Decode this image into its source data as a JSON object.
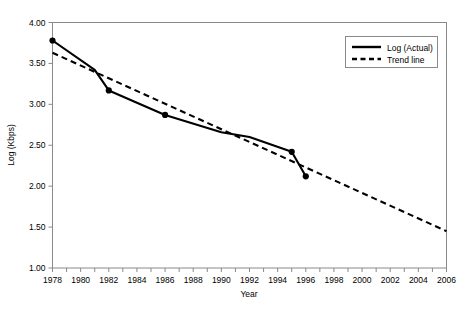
{
  "chart_data": {
    "type": "line",
    "title": "",
    "xlabel": "Year",
    "ylabel": "Log (Kbps)",
    "xlim": [
      1978,
      2006
    ],
    "ylim": [
      1.0,
      4.0
    ],
    "ytick_step": 0.5,
    "xtick_step": 2,
    "grid": false,
    "legend_position": "top-right",
    "xticks": [
      "1978",
      "1980",
      "1982",
      "1984",
      "1986",
      "1988",
      "1990",
      "1992",
      "1994",
      "1996",
      "1998",
      "2000",
      "2002",
      "2004",
      "2006"
    ],
    "yticks": [
      "1.00",
      "1.50",
      "2.00",
      "2.50",
      "3.00",
      "3.50",
      "4.00"
    ],
    "series": [
      {
        "name": "Log (Actual)",
        "style": "solid",
        "markers": true,
        "x": [
          1978,
          1981,
          1982,
          1986,
          1990,
          1992,
          1995,
          1996
        ],
        "values": [
          3.78,
          3.42,
          3.17,
          2.87,
          2.66,
          2.6,
          2.42,
          2.12
        ],
        "marker_x": [
          1978,
          1982,
          1986,
          1995,
          1996
        ],
        "marker_values": [
          3.78,
          3.17,
          2.87,
          2.42,
          2.12
        ]
      },
      {
        "name": "Trend line",
        "style": "dashed",
        "markers": false,
        "x": [
          1978,
          2006
        ],
        "values": [
          3.63,
          1.45
        ]
      }
    ]
  },
  "legend": {
    "items": [
      {
        "label": "Log (Actual)",
        "style": "solid"
      },
      {
        "label": "Trend line",
        "style": "dashed"
      }
    ]
  },
  "axes": {
    "x_title": "Year",
    "y_title": "Log (Kbps)"
  }
}
